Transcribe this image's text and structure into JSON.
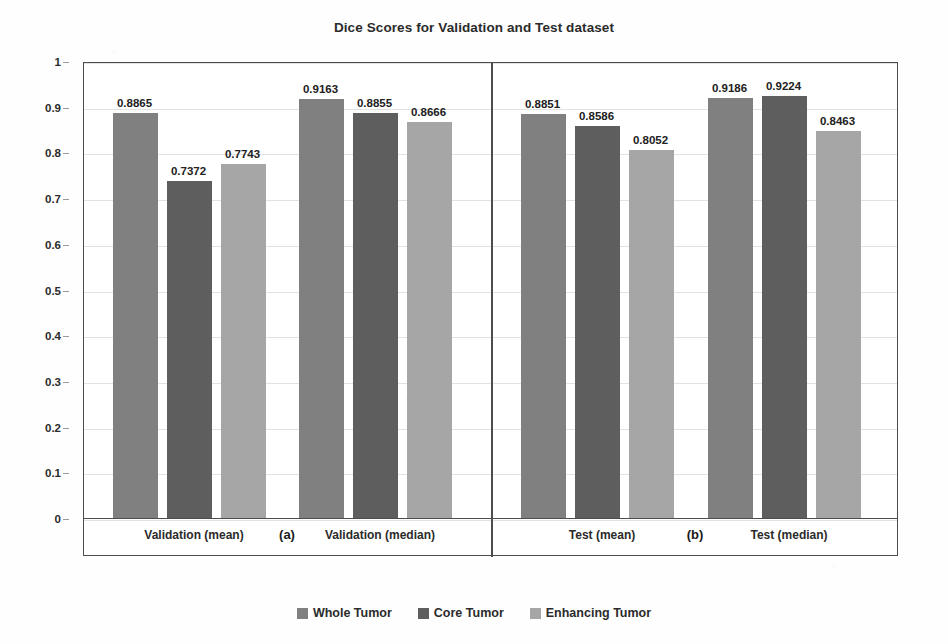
{
  "chart_data": {
    "type": "bar",
    "title": "Dice Scores for Validation and Test dataset",
    "xlabel": "",
    "ylabel": "",
    "ylim": [
      0,
      1
    ],
    "ytick_labels": [
      "1",
      "0.9",
      "0.8",
      "0.7",
      "0.6",
      "0.5",
      "0.4",
      "0.3",
      "0.2",
      "0.1",
      "0"
    ],
    "ytick_values": [
      1,
      0.9,
      0.8,
      0.7,
      0.6,
      0.5,
      0.4,
      0.3,
      0.2,
      0.1,
      0
    ],
    "grid": true,
    "legend_position": "bottom",
    "categories": [
      "Validation (mean)",
      "Validation (median)",
      "Test (mean)",
      "Test (median)"
    ],
    "series": [
      {
        "name": "Whole Tumor",
        "color": "#808080",
        "values": [
          0.8865,
          0.9163,
          0.8851,
          0.9186
        ]
      },
      {
        "name": "Core Tumor",
        "color": "#5e5e5e",
        "values": [
          0.7372,
          0.8855,
          0.8586,
          0.9224
        ]
      },
      {
        "name": "Enhancing Tumor",
        "color": "#a6a6a6",
        "values": [
          0.7743,
          0.8666,
          0.8052,
          0.8463
        ]
      }
    ],
    "data_labels": [
      [
        "0.8865",
        "0.7372",
        "0.7743"
      ],
      [
        "0.9163",
        "0.8855",
        "0.8666"
      ],
      [
        "0.8851",
        "0.8586",
        "0.8052"
      ],
      [
        "0.9186",
        "0.9224",
        "0.8463"
      ]
    ],
    "panels": [
      {
        "tag": "(a)",
        "categories": [
          "Validation (mean)",
          "Validation (median)"
        ]
      },
      {
        "tag": "(b)",
        "categories": [
          "Test (mean)",
          "Test (median)"
        ]
      }
    ],
    "annotations": [
      "(a)",
      "(b)"
    ]
  },
  "legend": {
    "items": [
      {
        "label": "Whole Tumor",
        "color": "#808080"
      },
      {
        "label": "Core Tumor",
        "color": "#5e5e5e"
      },
      {
        "label": "Enhancing Tumor",
        "color": "#a6a6a6"
      }
    ]
  },
  "axis": {
    "y_ticks": [
      "1",
      "0.9",
      "0.8",
      "0.7",
      "0.6",
      "0.5",
      "0.4",
      "0.3",
      "0.2",
      "0.1",
      "0"
    ]
  },
  "categories_flat": [
    "Validation (mean)",
    "(a)",
    "Validation (median)",
    "Test (mean)",
    "(b)",
    "Test (median)"
  ]
}
